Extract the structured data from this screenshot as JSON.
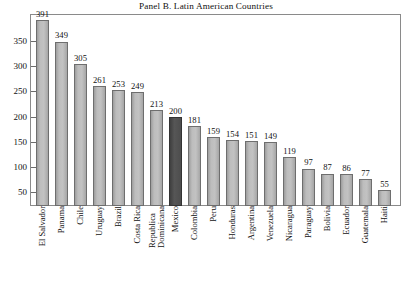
{
  "chart_data": {
    "type": "bar",
    "title": "Panel B. Latin American Countries",
    "xlabel": "",
    "ylabel": "",
    "ylim": [
      0,
      400
    ],
    "yticks": [
      50,
      100,
      150,
      200,
      250,
      300,
      350
    ],
    "grid": false,
    "legend": "none",
    "highlight_category": "Mexico",
    "highlight_color": "#4d4d4d",
    "bar_color": "#b5b5b5",
    "bar_edge_color": "#6e6e6e",
    "categories": [
      "El Salvador",
      "Panama",
      "Chile",
      "Uruguay",
      "Brazil",
      "Costa Rica",
      "Republica Dominicana",
      "Mexico",
      "Colombia",
      "Peru",
      "Honduras",
      "Argentina",
      "Venezuela",
      "Nicaragua",
      "Paraguay",
      "Bolivia",
      "Ecuador",
      "Guatemala",
      "Haiti"
    ],
    "values": [
      391,
      349,
      305,
      261,
      253,
      249,
      213,
      200,
      181,
      159,
      154,
      151,
      149,
      119,
      97,
      87,
      86,
      77,
      55
    ],
    "value_labels": [
      "391",
      "349",
      "305",
      "261",
      "253",
      "249",
      "213",
      "200",
      "181",
      "159",
      "154",
      "151",
      "149",
      "119",
      "97",
      "87",
      "86",
      "77",
      "55"
    ],
    "category_label_lines": [
      [
        "El Salvador"
      ],
      [
        "Panama"
      ],
      [
        "Chile"
      ],
      [
        "Uruguay"
      ],
      [
        "Brazil"
      ],
      [
        "Costa Rica"
      ],
      [
        "Republica",
        "Dominicana"
      ],
      [
        "Mexico"
      ],
      [
        "Colombia"
      ],
      [
        "Peru"
      ],
      [
        "Honduras"
      ],
      [
        "Argentina"
      ],
      [
        "Venezuela"
      ],
      [
        "Nicaragua"
      ],
      [
        "Paraguay"
      ],
      [
        "Bolivia"
      ],
      [
        "Ecuador"
      ],
      [
        "Guatemala"
      ],
      [
        "Haiti"
      ]
    ]
  }
}
